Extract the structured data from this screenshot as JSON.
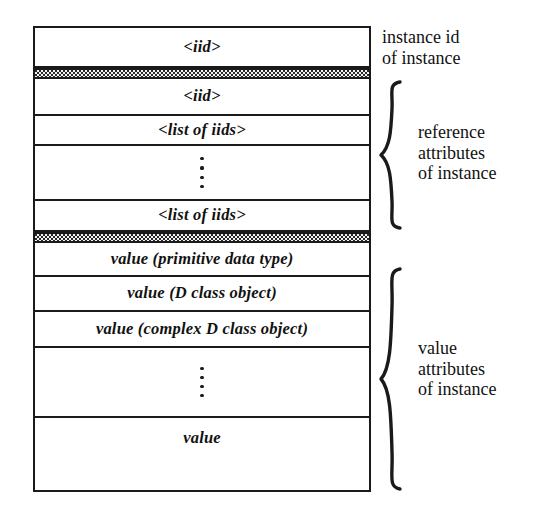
{
  "diagram": {
    "colors": {
      "ink": "#1a1a1a",
      "paper": "#ffffff",
      "band_fill": "#f2f2f2"
    },
    "record": {
      "sections": [
        {
          "id": "instance-id",
          "annotation": "instance id\nof instance",
          "has_brace": false,
          "rows": [
            {
              "type": "field",
              "label": "<iid>"
            }
          ]
        },
        {
          "id": "reference-attributes",
          "annotation": "reference\nattributes\nof instance",
          "has_brace": true,
          "rows": [
            {
              "type": "field",
              "label": "<iid>"
            },
            {
              "type": "field",
              "label": "<list of iids>"
            },
            {
              "type": "ellipsis",
              "label": ""
            },
            {
              "type": "field",
              "label": "<list of iids>"
            }
          ]
        },
        {
          "id": "value-attributes",
          "annotation": "value\nattributes\nof instance",
          "has_brace": true,
          "rows": [
            {
              "type": "field",
              "label": "value  (primitive data type)"
            },
            {
              "type": "field",
              "label": "value  (D class object)"
            },
            {
              "type": "field",
              "label": "value  (complex D class object)"
            },
            {
              "type": "ellipsis",
              "label": ""
            },
            {
              "type": "field",
              "label": "value"
            }
          ]
        }
      ],
      "separators": [
        {
          "id": "sep-after-instance-id",
          "style": "stippled-band"
        },
        {
          "id": "sep-after-reference-attributes",
          "style": "stippled-band"
        }
      ]
    },
    "row_labels": {
      "instance_iid": "<iid>",
      "reference_iid": "<iid>",
      "reference_list_first": "<list of iids>",
      "reference_list_last": "<list of iids>",
      "value_primitive": "value  (primitive data type)",
      "value_d_class": "value  (D class object)",
      "value_complex_d_class": "value  (complex D class object)",
      "value_last": "value"
    },
    "annotations": {
      "instance_id": "instance id\nof instance",
      "reference_attributes": "reference\nattributes\nof instance",
      "value_attributes": "value\nattributes\nof instance"
    }
  }
}
